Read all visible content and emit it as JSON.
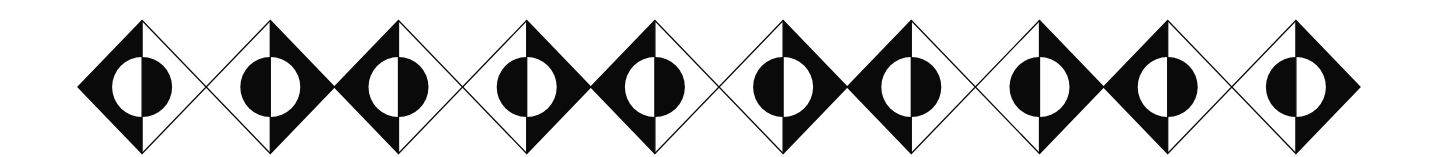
{
  "figure": {
    "width": 1438,
    "height": 157,
    "background": "#ffffff",
    "ink": "#0a0a0a",
    "pattern": {
      "count": 10,
      "start_x": 78,
      "diamond_width": 128.2,
      "center_y": 87,
      "half_height": 66.5,
      "circle_radius": 30,
      "stroke_width": 1.3
    },
    "diamonds": [
      {
        "index": 1,
        "variant": "A",
        "left_half": "black",
        "right_half": "white",
        "circle_left": "white",
        "circle_right": "black"
      },
      {
        "index": 2,
        "variant": "B",
        "left_half": "white",
        "right_half": "black",
        "circle_left": "black",
        "circle_right": "white"
      },
      {
        "index": 3,
        "variant": "A",
        "left_half": "black",
        "right_half": "white",
        "circle_left": "white",
        "circle_right": "black"
      },
      {
        "index": 4,
        "variant": "B",
        "left_half": "white",
        "right_half": "black",
        "circle_left": "black",
        "circle_right": "white"
      },
      {
        "index": 5,
        "variant": "A",
        "left_half": "black",
        "right_half": "white",
        "circle_left": "white",
        "circle_right": "black"
      },
      {
        "index": 6,
        "variant": "B",
        "left_half": "white",
        "right_half": "black",
        "circle_left": "black",
        "circle_right": "white"
      },
      {
        "index": 7,
        "variant": "A",
        "left_half": "black",
        "right_half": "white",
        "circle_left": "white",
        "circle_right": "black"
      },
      {
        "index": 8,
        "variant": "B",
        "left_half": "white",
        "right_half": "black",
        "circle_left": "black",
        "circle_right": "white"
      },
      {
        "index": 9,
        "variant": "A",
        "left_half": "black",
        "right_half": "white",
        "circle_left": "white",
        "circle_right": "black"
      },
      {
        "index": 10,
        "variant": "B",
        "left_half": "white",
        "right_half": "black",
        "circle_left": "black",
        "circle_right": "white"
      }
    ]
  }
}
